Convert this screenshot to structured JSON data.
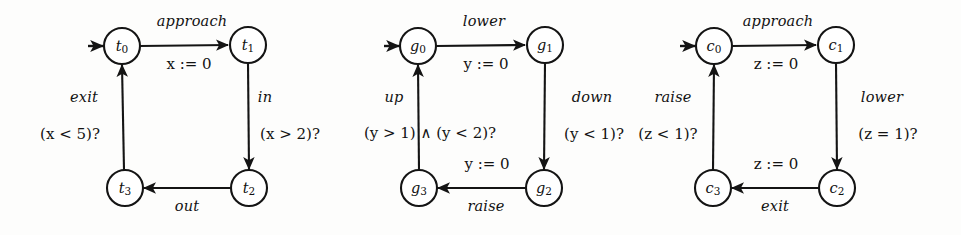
{
  "figure": {
    "kind": "timed-automata-diagram",
    "background_color": "#fdfdfc",
    "ink_color": "#141414",
    "automata_count": 3
  },
  "train": {
    "name": "train-automaton",
    "initial_state": "t0",
    "states": [
      {
        "id": "t0",
        "base": "t",
        "sub": "0",
        "cx": 122,
        "cy": 46
      },
      {
        "id": "t1",
        "base": "t",
        "sub": "1",
        "cx": 248,
        "cy": 45
      },
      {
        "id": "t2",
        "base": "t",
        "sub": "2",
        "cx": 249,
        "cy": 188
      },
      {
        "id": "t3",
        "base": "t",
        "sub": "3",
        "cx": 125,
        "cy": 188
      }
    ],
    "transitions": [
      {
        "id": "t0-t1",
        "from": "t0",
        "to": "t1",
        "event": "approach",
        "assign_var": "x",
        "assign_value": "0",
        "guard": ""
      },
      {
        "id": "t1-t2",
        "from": "t1",
        "to": "t2",
        "event": "in",
        "assign_var": "",
        "assign_value": "",
        "guard_var": "x",
        "guard_op": ">",
        "guard_value": "2"
      },
      {
        "id": "t2-t3",
        "from": "t2",
        "to": "t3",
        "event": "out",
        "assign_var": "",
        "assign_value": "",
        "guard": ""
      },
      {
        "id": "t3-t0",
        "from": "t3",
        "to": "t0",
        "event": "exit",
        "assign_var": "",
        "assign_value": "",
        "guard_var": "x",
        "guard_op": "<",
        "guard_value": "5"
      }
    ],
    "labels": {
      "top_event": "approach",
      "top_assign": "x := 0",
      "right_event": "in",
      "right_guard": "(x > 2)?",
      "bottom_event": "out",
      "left_event": "exit",
      "left_guard": "(x < 5)?"
    }
  },
  "gate": {
    "name": "gate-automaton",
    "initial_state": "g0",
    "states": [
      {
        "id": "g0",
        "base": "g",
        "sub": "0",
        "cx": 418,
        "cy": 46
      },
      {
        "id": "g1",
        "base": "g",
        "sub": "1",
        "cx": 545,
        "cy": 45
      },
      {
        "id": "g2",
        "base": "g",
        "sub": "2",
        "cx": 544,
        "cy": 188
      },
      {
        "id": "g3",
        "base": "g",
        "sub": "3",
        "cx": 419,
        "cy": 188
      }
    ],
    "transitions": [
      {
        "id": "g0-g1",
        "from": "g0",
        "to": "g1",
        "event": "lower",
        "assign_var": "y",
        "assign_value": "0",
        "guard": ""
      },
      {
        "id": "g1-g2",
        "from": "g1",
        "to": "g2",
        "event": "down",
        "assign_var": "",
        "assign_value": "",
        "guard_var": "y",
        "guard_op": "<",
        "guard_value": "1"
      },
      {
        "id": "g2-g3",
        "from": "g2",
        "to": "g3",
        "event": "raise",
        "assign_var": "y",
        "assign_value": "0",
        "guard": ""
      },
      {
        "id": "g3-g0",
        "from": "g3",
        "to": "g0",
        "event": "up",
        "assign_var": "",
        "assign_value": "",
        "guard": "(y > 1) ∧ (y < 2)?"
      }
    ],
    "labels": {
      "top_event": "lower",
      "top_assign": "y := 0",
      "right_event": "down",
      "right_guard": "(y < 1)?",
      "bottom_event": "raise",
      "bottom_assign": "y := 0",
      "left_event": "up",
      "left_guard": "(y > 1) ∧ (y < 2)?"
    }
  },
  "controller": {
    "name": "controller-automaton",
    "initial_state": "c0",
    "states": [
      {
        "id": "c0",
        "base": "c",
        "sub": "0",
        "cx": 714,
        "cy": 46
      },
      {
        "id": "c1",
        "base": "c",
        "sub": "1",
        "cx": 836,
        "cy": 45
      },
      {
        "id": "c2",
        "base": "c",
        "sub": "2",
        "cx": 837,
        "cy": 188
      },
      {
        "id": "c3",
        "base": "c",
        "sub": "3",
        "cx": 713,
        "cy": 188
      }
    ],
    "transitions": [
      {
        "id": "c0-c1",
        "from": "c0",
        "to": "c1",
        "event": "approach",
        "assign_var": "z",
        "assign_value": "0",
        "guard": ""
      },
      {
        "id": "c1-c2",
        "from": "c1",
        "to": "c2",
        "event": "lower",
        "assign_var": "",
        "assign_value": "",
        "guard_var": "z",
        "guard_op": "=",
        "guard_value": "1"
      },
      {
        "id": "c2-c3",
        "from": "c2",
        "to": "c3",
        "event": "exit",
        "assign_var": "z",
        "assign_value": "0",
        "guard": ""
      },
      {
        "id": "c3-c0",
        "from": "c3",
        "to": "c0",
        "event": "raise",
        "assign_var": "",
        "assign_value": "",
        "guard_var": "z",
        "guard_op": "<",
        "guard_value": "1"
      }
    ],
    "labels": {
      "top_event": "approach",
      "top_assign": "z := 0",
      "right_event": "lower",
      "right_guard": "(z = 1)?",
      "bottom_event": "exit",
      "bottom_assign": "z := 0",
      "left_event": "raise",
      "left_guard": "(z < 1)?"
    }
  }
}
